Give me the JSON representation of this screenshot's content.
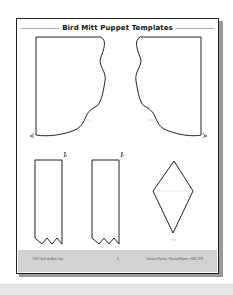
{
  "document": {
    "title": "Bird Mitt Puppet Templates",
    "pieces": [
      {
        "id": "wing-left",
        "label": "Wing",
        "shape": "wing"
      },
      {
        "id": "wing-right",
        "label": "Wing",
        "shape": "wing-mirrored"
      },
      {
        "id": "tail-strip-1",
        "label": "Tail",
        "shape": "strip-zigzag"
      },
      {
        "id": "tail-strip-2",
        "label": "Tail",
        "shape": "strip-zigzag"
      },
      {
        "id": "beak",
        "label": "Beak",
        "shape": "diamond"
      }
    ],
    "icons": [
      "scissors-icon",
      "scissors-icon",
      "scissors-icon",
      "scissors-icon"
    ],
    "footer": {
      "left": "©2007 by Evan-Moor Corp.",
      "center": "8",
      "right": "Literature Pockets • Nursery Rhymes • EMC 2736"
    }
  },
  "colors": {
    "line": "#222222",
    "footer_band": "#d2d2d2",
    "shadow": "#9a9a9a"
  }
}
